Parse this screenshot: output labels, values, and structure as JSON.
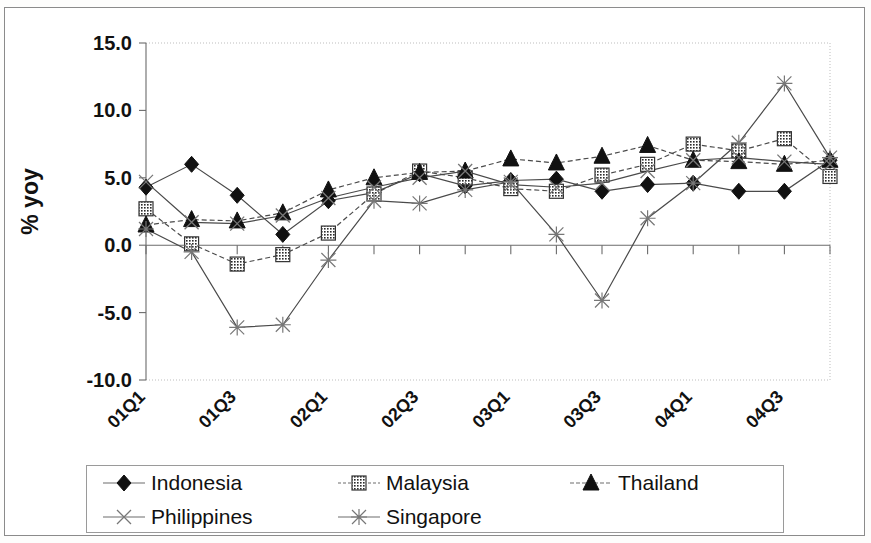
{
  "chart_data": {
    "type": "line",
    "title": "",
    "subtitle": "",
    "xlabel": "",
    "ylabel": "% yoy",
    "ylim": [
      -10.0,
      15.0
    ],
    "ytick_labels": [
      "15.0",
      "10.0",
      "5.0",
      "0.0",
      "-5.0",
      "-10.0"
    ],
    "ytick_values": [
      15.0,
      10.0,
      5.0,
      0.0,
      -5.0,
      -10.0
    ],
    "grid": false,
    "legend_position": "bottom",
    "categories": [
      "01Q1",
      "01Q2",
      "01Q3",
      "01Q4",
      "02Q1",
      "02Q2",
      "02Q3",
      "02Q4",
      "03Q1",
      "03Q2",
      "03Q3",
      "03Q4",
      "04Q1",
      "04Q2",
      "04Q3",
      "04Q4"
    ],
    "xtick_labels_shown": [
      "01Q1",
      "01Q3",
      "02Q1",
      "02Q3",
      "03Q1",
      "03Q3",
      "04Q1",
      "04Q3"
    ],
    "xtick_label_indices": [
      0,
      2,
      4,
      6,
      8,
      10,
      12,
      14
    ],
    "series": [
      {
        "name": "Indonesia",
        "marker": "filled-diamond",
        "line": "solid",
        "values": [
          4.3,
          6.0,
          3.7,
          0.8,
          3.3,
          3.9,
          5.3,
          4.4,
          4.8,
          4.9,
          4.0,
          4.5,
          4.6,
          4.0,
          4.0,
          6.3
        ]
      },
      {
        "name": "Malaysia",
        "marker": "filled-square",
        "line": "dashed",
        "values": [
          2.7,
          0.1,
          -1.4,
          -0.7,
          0.9,
          3.8,
          5.5,
          5.0,
          4.2,
          4.0,
          5.2,
          6.0,
          7.5,
          7.0,
          7.9,
          5.1
        ]
      },
      {
        "name": "Thailand",
        "marker": "filled-triangle",
        "line": "dashed",
        "values": [
          1.5,
          1.9,
          1.8,
          2.4,
          4.1,
          5.0,
          5.4,
          5.5,
          6.4,
          6.1,
          6.6,
          7.4,
          6.3,
          6.2,
          6.0,
          6.3
        ]
      },
      {
        "name": "Philippines",
        "marker": "cross-x",
        "line": "solid",
        "values": [
          4.7,
          1.7,
          1.6,
          2.2,
          3.5,
          4.3,
          5.0,
          5.5,
          4.5,
          4.3,
          4.6,
          5.5,
          6.3,
          6.5,
          6.2,
          6.0
        ]
      },
      {
        "name": "Singapore",
        "marker": "asterisk",
        "line": "solid",
        "values": [
          1.2,
          -0.5,
          -6.1,
          -5.9,
          -1.1,
          3.3,
          3.1,
          4.1,
          4.7,
          0.8,
          -4.1,
          2.0,
          4.6,
          7.6,
          12.0,
          6.5
        ]
      }
    ]
  },
  "legend": {
    "items": [
      {
        "label": "Indonesia",
        "marker": "filled-diamond"
      },
      {
        "label": "Malaysia",
        "marker": "filled-square"
      },
      {
        "label": "Thailand",
        "marker": "filled-triangle"
      },
      {
        "label": "Philippines",
        "marker": "cross-x"
      },
      {
        "label": "Singapore",
        "marker": "asterisk"
      }
    ]
  },
  "axes": {
    "y_title": "% yoy"
  }
}
